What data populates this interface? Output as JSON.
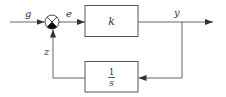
{
  "diagram": {
    "type": "feedback-block-diagram",
    "colors": {
      "line": "#555555",
      "text": "#333333",
      "background": "#ffffff"
    },
    "signals": {
      "input": "g",
      "error": "e",
      "output": "y",
      "feedback": "z"
    },
    "blocks": {
      "forward": {
        "label": "k"
      },
      "feedback": {
        "numerator": "1",
        "denominator": "s"
      }
    },
    "summing_junction": {
      "symbol": "circle-with-cross",
      "filled_quadrant": "bottom"
    }
  }
}
